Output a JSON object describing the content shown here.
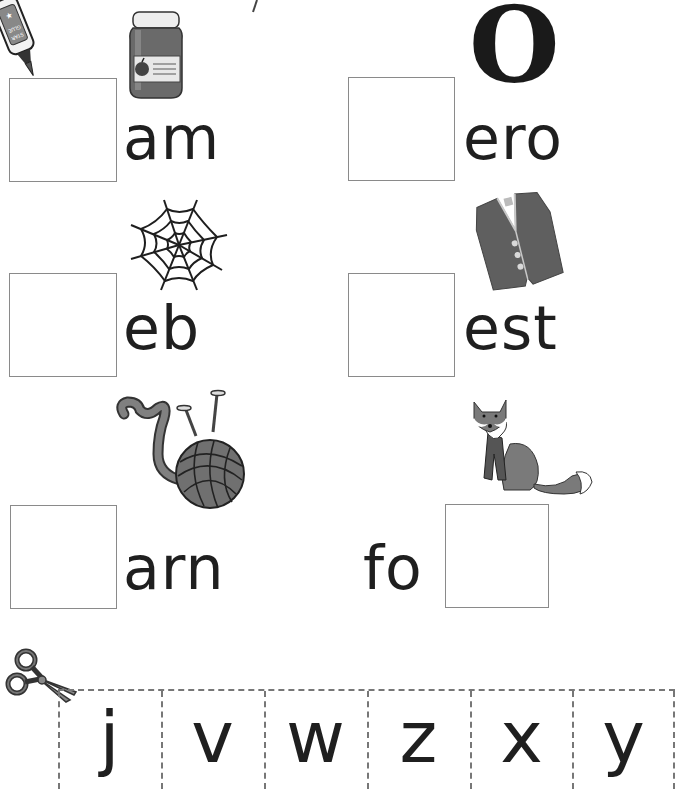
{
  "worksheet": {
    "items": [
      {
        "picture": "jam-jar-icon",
        "blank_position": "start",
        "word_part": "am"
      },
      {
        "picture": "letter-o-graphic",
        "picture_text": "O",
        "blank_position": "start",
        "word_part": "ero"
      },
      {
        "picture": "spider-web-icon",
        "blank_position": "start",
        "word_part": "eb"
      },
      {
        "picture": "vest-icon",
        "blank_position": "start",
        "word_part": "est"
      },
      {
        "picture": "yarn-ball-icon",
        "blank_position": "start",
        "word_part": "arn"
      },
      {
        "picture": "fox-icon",
        "blank_position": "end",
        "word_part": "fo"
      }
    ],
    "glue_label": "STAR GLUE",
    "cut_strip": {
      "letters": [
        "j",
        "v",
        "w",
        "z",
        "x",
        "y"
      ]
    }
  },
  "colors": {
    "ink": "#1f1f1f",
    "box_border": "#8a8a8a",
    "dash": "#777777",
    "gray_fill": "#6e6e6e"
  }
}
